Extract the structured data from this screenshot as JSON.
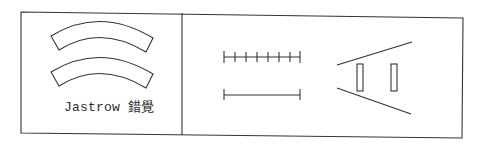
{
  "figure": {
    "colors": {
      "stroke": "#333333",
      "background": "#ffffff"
    },
    "left_panel": {
      "caption": "Jastrow 錯覺",
      "shapes": [
        "arc-band-top",
        "arc-band-bottom"
      ]
    },
    "right_panel": {
      "ruler_top": {
        "tick_count": 8
      },
      "ruler_bottom": {
        "tick_count": 2
      },
      "ponzo": {
        "rectangles": 2
      }
    }
  }
}
